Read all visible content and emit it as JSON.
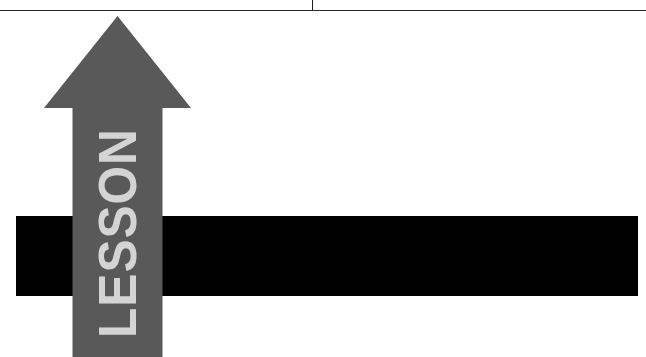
{
  "page": {
    "background_color": "#ffffff",
    "width": 646,
    "height": 357
  },
  "rules": {
    "horizontal": {
      "name": "horizontal-rule",
      "color": "#2a2a2a"
    },
    "vertical": {
      "name": "vertical-tick",
      "color": "#1e1e1e"
    }
  },
  "banner": {
    "bar_color": "#000000"
  },
  "arrow": {
    "label": "LESSON",
    "fill_color": "#595959",
    "label_color": "#d4d4d4",
    "direction": "up"
  }
}
